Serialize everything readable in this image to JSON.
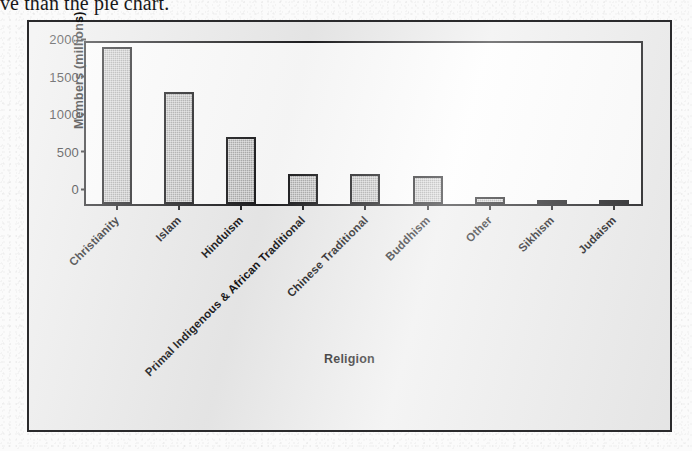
{
  "document": {
    "body_text_fragment": "ve than the pie chart."
  },
  "figure": {
    "bar_fill_color": "#a9a9a9",
    "bar_outline_color": "#1b1b1d",
    "frame_color": "#2a2a2c",
    "plot_background": "#fdfdfd"
  },
  "chart_data": {
    "type": "bar",
    "title": "",
    "xlabel": "Religion",
    "ylabel": "Members (millions)",
    "ylim": [
      0,
      2200
    ],
    "yticks": [
      0,
      500,
      1000,
      1500,
      2000
    ],
    "ytick_labels": [
      "0",
      "500",
      "1000",
      "1500",
      "2000"
    ],
    "grid": false,
    "legend": false,
    "categories": [
      "Christianity",
      "Islam",
      "Hinduism",
      "Primal Indigenous & African Traditional",
      "Chinese Traditional",
      "Buddhism",
      "Other",
      "Sikhism",
      "Judaism"
    ],
    "values": [
      2100,
      1500,
      900,
      400,
      394,
      376,
      100,
      23,
      14
    ]
  }
}
